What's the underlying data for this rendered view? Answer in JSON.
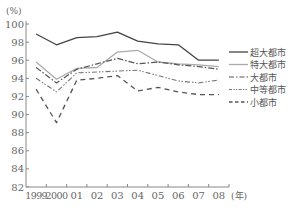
{
  "chart_data": {
    "type": "line",
    "title": "",
    "ylabel": "(%)",
    "xlabel": "(年)",
    "ylim": [
      82,
      100
    ],
    "yticks": [
      82,
      84,
      86,
      88,
      90,
      92,
      94,
      96,
      98,
      100
    ],
    "grid": false,
    "legend_position": "right-inside",
    "categories": [
      "1999",
      "2000",
      "01",
      "02",
      "03",
      "04",
      "05",
      "06",
      "07",
      "08"
    ],
    "series": [
      {
        "name": "超大都市",
        "style": "solid",
        "color": "#444444",
        "values": [
          98.9,
          97.7,
          98.5,
          98.6,
          99.1,
          98.1,
          97.8,
          97.7,
          96.0,
          96.0
        ]
      },
      {
        "name": "特大都市",
        "style": "solid-light",
        "color": "#aaaaaa",
        "values": [
          95.8,
          93.9,
          95.1,
          95.2,
          96.9,
          97.1,
          95.8,
          95.6,
          95.5,
          95.3
        ]
      },
      {
        "name": "大都市",
        "style": "dash-dot",
        "color": "#555555",
        "values": [
          95.2,
          93.5,
          95.0,
          95.6,
          96.2,
          95.6,
          95.8,
          95.5,
          95.3,
          95.0
        ]
      },
      {
        "name": "中等都市",
        "style": "dash-dot-dot",
        "color": "#777777",
        "values": [
          94.0,
          92.5,
          94.6,
          94.7,
          94.8,
          94.9,
          94.3,
          93.7,
          93.5,
          93.8
        ]
      },
      {
        "name": "小都市",
        "style": "dashed",
        "color": "#555555",
        "values": [
          92.8,
          89.1,
          93.8,
          94.0,
          94.3,
          92.6,
          93.0,
          92.5,
          92.2,
          92.2
        ]
      }
    ]
  }
}
